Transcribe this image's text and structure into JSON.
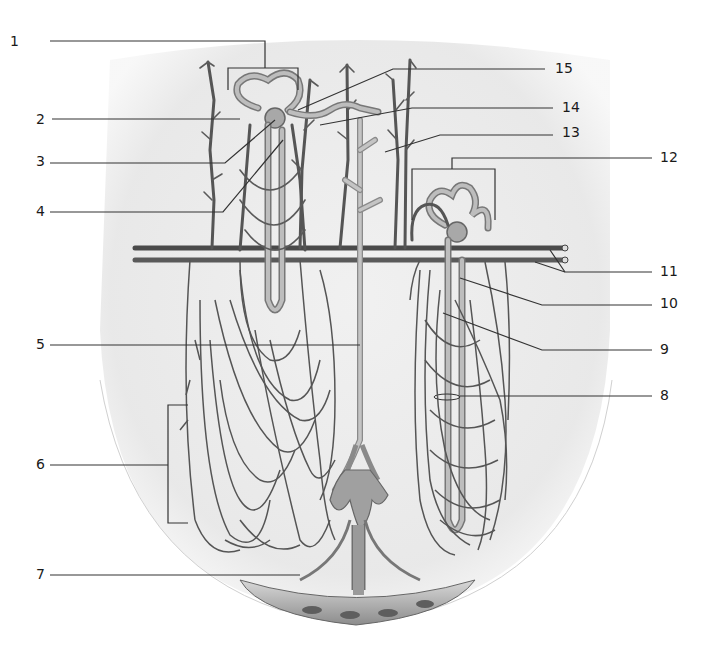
{
  "figure": {
    "colors": {
      "background": "#ffffff",
      "organ_fill": "#ececec",
      "vessel": "#555555",
      "tubule": "#7a7a7a",
      "tubule_light": "#bdbdbd",
      "label_text": "#1a1a1a",
      "leader": "#333333"
    }
  },
  "labels": {
    "left": [
      {
        "id": "1",
        "text": "1",
        "x": 12,
        "y": 44
      },
      {
        "id": "2",
        "text": "2",
        "x": 37,
        "y": 122
      },
      {
        "id": "3",
        "text": "3",
        "x": 37,
        "y": 160
      },
      {
        "id": "4",
        "text": "4",
        "x": 37,
        "y": 216
      },
      {
        "id": "5",
        "text": "5",
        "x": 37,
        "y": 346
      },
      {
        "id": "6",
        "text": "6",
        "x": 37,
        "y": 469
      },
      {
        "id": "7",
        "text": "7",
        "x": 37,
        "y": 582
      }
    ],
    "right": [
      {
        "id": "15",
        "text": "15",
        "x": 553,
        "y": 72
      },
      {
        "id": "14",
        "text": "14",
        "x": 561,
        "y": 110
      },
      {
        "id": "13",
        "text": "13",
        "x": 561,
        "y": 136
      },
      {
        "id": "12",
        "text": "12",
        "x": 660,
        "y": 160
      },
      {
        "id": "11",
        "text": "11",
        "x": 660,
        "y": 274
      },
      {
        "id": "10",
        "text": "10",
        "x": 660,
        "y": 304
      },
      {
        "id": "9",
        "text": "9",
        "x": 660,
        "y": 350
      },
      {
        "id": "8",
        "text": "8",
        "x": 660,
        "y": 398
      }
    ]
  }
}
